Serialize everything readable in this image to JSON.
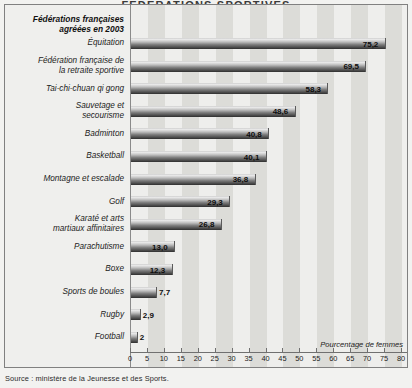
{
  "figure": {
    "title": "FEDERATIONS SPORTIVES",
    "legend_header": "Fédérations françaises\nagréées en 2003",
    "axis_caption": "Pourcentage de femmes",
    "source": "Source : ministère de la Jeunesse et des Sports."
  },
  "colors": {
    "background": "#efefed",
    "frame_border": "#808080",
    "stripe_light": "#eeeeec",
    "stripe_dark": "#dcdcd8",
    "bar_top": "#e8e8e8",
    "bar_bottom": "#2e2e2e",
    "axis": "#707070",
    "text": "#1c1c1c"
  },
  "chart_data": {
    "type": "bar",
    "orientation": "horizontal",
    "xlabel": "Pourcentage de femmes",
    "ylabel": "",
    "xlim": [
      0,
      80
    ],
    "xticks": [
      0,
      5,
      10,
      15,
      20,
      25,
      30,
      35,
      40,
      45,
      50,
      55,
      60,
      65,
      70,
      75,
      80
    ],
    "grid": false,
    "stripes": true,
    "legend": null,
    "categories": [
      "Équitation",
      "Fédération française de\nla retraite sportive",
      "Tai-chi-chuan qi gong",
      "Sauvetage et\nsecourisme",
      "Badminton",
      "Basketball",
      "Montagne et escalade",
      "Golf",
      "Karaté et arts\nmartiaux affinitaires",
      "Parachutisme",
      "Boxe",
      "Sports de boules",
      "Rugby",
      "Football"
    ],
    "values": [
      75.2,
      69.5,
      58.3,
      48.6,
      40.8,
      40.1,
      36.8,
      29.3,
      26.8,
      13.0,
      12.3,
      7.7,
      2.9,
      2.0
    ],
    "value_labels": [
      "75,2",
      "69,5",
      "58,3",
      "48,6",
      "40,8",
      "40,1",
      "36,8",
      "29,3",
      "26,8",
      "13,0",
      "12,3",
      "7,7",
      "2,9",
      "2"
    ],
    "tick_labels": [
      "0",
      "5",
      "10",
      "15",
      "20",
      "25",
      "30",
      "35",
      "40",
      "45",
      "50",
      "55",
      "60",
      "65",
      "70",
      "75",
      "80"
    ]
  }
}
